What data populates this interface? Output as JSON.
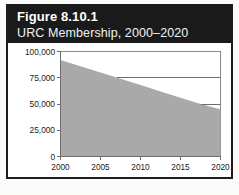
{
  "figure": {
    "number_label": "Figure 8.10.1",
    "subtitle": "URC Membership, 2000–2020",
    "header_background": "#1a1a1a",
    "header_text_color": "#ffffff",
    "border_color": "#1c1c1c",
    "page_background": "#fbfbfa"
  },
  "chart_data": {
    "type": "area",
    "title": "URC Membership, 2000–2020",
    "xlabel": "",
    "ylabel": "",
    "xlim": [
      2000,
      2020
    ],
    "ylim": [
      0,
      100000
    ],
    "grid": "partial-horizontal",
    "legend": "none",
    "fill_color": "#a9a9a9",
    "axis_color": "#6e6e6e",
    "y_ticks": [
      0,
      25000,
      50000,
      75000,
      100000
    ],
    "y_tick_labels": [
      "0",
      "25,000",
      "50,000",
      "75,000",
      "100,000"
    ],
    "x_ticks": [
      2000,
      2005,
      2010,
      2015,
      2020
    ],
    "x_tick_labels": [
      "2000",
      "2005",
      "2010",
      "2015",
      "2020"
    ],
    "x": [
      2000,
      2001,
      2002,
      2003,
      2004,
      2005,
      2006,
      2007,
      2008,
      2009,
      2010,
      2011,
      2012,
      2013,
      2014,
      2015,
      2016,
      2017,
      2018,
      2019,
      2020
    ],
    "values": [
      92000,
      89600,
      87200,
      84800,
      82400,
      80000,
      77600,
      75200,
      72800,
      70400,
      68000,
      65600,
      63200,
      60800,
      58400,
      56000,
      53600,
      51200,
      49000,
      47000,
      45000
    ],
    "series": [
      {
        "name": "URC Membership",
        "values": [
          92000,
          89600,
          87200,
          84800,
          82400,
          80000,
          77600,
          75200,
          72800,
          70400,
          68000,
          65600,
          63200,
          60800,
          58400,
          56000,
          53600,
          51200,
          49000,
          47000,
          45000
        ]
      }
    ],
    "gridline_values": [
      75000,
      50000
    ],
    "annotations": []
  }
}
